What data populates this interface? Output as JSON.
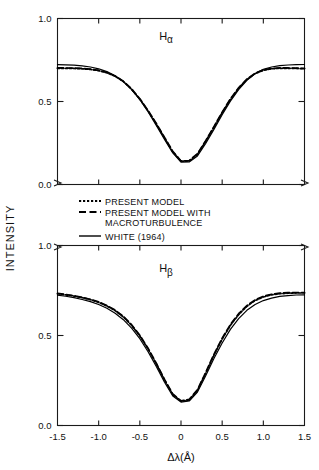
{
  "figure": {
    "ylabel": "INTENSITY",
    "xlabel": "Δλ(Å)",
    "background": "#ffffff",
    "ink": "#000000"
  },
  "legend": {
    "items": [
      {
        "label": "PRESENT MODEL",
        "style": "dotted",
        "swatch": "----"
      },
      {
        "label": "PRESENT MODEL WITH",
        "label2": "MACROTURBULENCE",
        "style": "dashed",
        "swatch": "– –"
      },
      {
        "label": "WHITE (1964)",
        "style": "solid",
        "swatch": "—"
      }
    ]
  },
  "panels": [
    {
      "title": "Hα",
      "title_base": "H",
      "title_sub": "α",
      "yticks": [
        "0.0",
        "0.5",
        "1.0"
      ],
      "ytickvals": [
        0.0,
        0.5,
        1.0
      ],
      "ylim": [
        0.0,
        1.0
      ]
    },
    {
      "title": "Hβ",
      "title_base": "H",
      "title_sub": "β",
      "yticks": [
        "0.0",
        "0.5",
        "1.0"
      ],
      "ytickvals": [
        0.0,
        0.5,
        1.0
      ],
      "ylim": [
        0.0,
        1.0
      ]
    }
  ],
  "xaxis": {
    "ticks": [
      "-1.5",
      "-1.0",
      "-0.5",
      "0",
      "0.5",
      "1.0",
      "1.5"
    ],
    "tickvals": [
      -1.5,
      -1.0,
      -0.5,
      0.0,
      0.5,
      1.0,
      1.5
    ],
    "xlim": [
      -1.5,
      1.5
    ]
  },
  "chart_data": {
    "type": "line",
    "title": "",
    "xlabel": "Δλ(Å)",
    "ylabel": "INTENSITY",
    "xlim": [
      -1.5,
      1.5
    ],
    "ylim": [
      0.0,
      1.0
    ],
    "grid": false,
    "legend_position": "center",
    "panels": [
      {
        "name": "H-alpha",
        "label": "Hα",
        "x": [
          -1.5,
          -1.4,
          -1.3,
          -1.2,
          -1.1,
          -1.0,
          -0.9,
          -0.8,
          -0.7,
          -0.6,
          -0.5,
          -0.4,
          -0.3,
          -0.2,
          -0.1,
          0.0,
          0.1,
          0.2,
          0.3,
          0.4,
          0.5,
          0.6,
          0.7,
          0.8,
          0.9,
          1.0,
          1.1,
          1.2,
          1.3,
          1.4,
          1.5
        ],
        "series": [
          {
            "name": "PRESENT MODEL",
            "style": "dotted",
            "values": [
              0.7,
              0.7,
              0.699,
              0.697,
              0.693,
              0.686,
              0.673,
              0.652,
              0.62,
              0.574,
              0.514,
              0.443,
              0.364,
              0.28,
              0.196,
              0.14,
              0.142,
              0.182,
              0.26,
              0.345,
              0.432,
              0.512,
              0.58,
              0.632,
              0.668,
              0.688,
              0.697,
              0.7,
              0.7,
              0.699,
              0.697
            ]
          },
          {
            "name": "PRESENT MODEL WITH MACROTURBULENCE",
            "style": "dashed",
            "values": [
              0.702,
              0.702,
              0.701,
              0.699,
              0.695,
              0.688,
              0.675,
              0.654,
              0.622,
              0.576,
              0.517,
              0.446,
              0.368,
              0.284,
              0.2,
              0.142,
              0.144,
              0.186,
              0.264,
              0.349,
              0.436,
              0.516,
              0.583,
              0.635,
              0.67,
              0.69,
              0.699,
              0.702,
              0.702,
              0.701,
              0.699
            ]
          },
          {
            "name": "WHITE (1964)",
            "style": "solid",
            "values": [
              0.722,
              0.721,
              0.719,
              0.715,
              0.708,
              0.697,
              0.68,
              0.655,
              0.62,
              0.572,
              0.512,
              0.438,
              0.356,
              0.272,
              0.19,
              0.135,
              0.136,
              0.172,
              0.248,
              0.332,
              0.42,
              0.502,
              0.572,
              0.628,
              0.668,
              0.694,
              0.708,
              0.716,
              0.72,
              0.722,
              0.723
            ]
          }
        ]
      },
      {
        "name": "H-beta",
        "label": "Hβ",
        "x": [
          -1.5,
          -1.4,
          -1.3,
          -1.2,
          -1.1,
          -1.0,
          -0.9,
          -0.8,
          -0.7,
          -0.6,
          -0.5,
          -0.4,
          -0.3,
          -0.2,
          -0.1,
          0.0,
          0.1,
          0.2,
          0.3,
          0.4,
          0.5,
          0.6,
          0.7,
          0.8,
          0.9,
          1.0,
          1.1,
          1.2,
          1.3,
          1.4,
          1.5
        ],
        "series": [
          {
            "name": "PRESENT MODEL",
            "style": "dotted",
            "values": [
              0.732,
              0.726,
              0.719,
              0.71,
              0.699,
              0.684,
              0.664,
              0.638,
              0.603,
              0.556,
              0.497,
              0.425,
              0.342,
              0.252,
              0.172,
              0.135,
              0.142,
              0.195,
              0.29,
              0.39,
              0.48,
              0.556,
              0.616,
              0.662,
              0.694,
              0.714,
              0.726,
              0.732,
              0.735,
              0.736,
              0.736
            ]
          },
          {
            "name": "PRESENT MODEL WITH MACROTURBULENCE",
            "style": "dashed",
            "values": [
              0.734,
              0.728,
              0.721,
              0.712,
              0.701,
              0.687,
              0.667,
              0.641,
              0.606,
              0.56,
              0.501,
              0.429,
              0.346,
              0.256,
              0.175,
              0.137,
              0.145,
              0.199,
              0.295,
              0.395,
              0.485,
              0.561,
              0.621,
              0.666,
              0.698,
              0.718,
              0.729,
              0.735,
              0.738,
              0.739,
              0.739
            ]
          },
          {
            "name": "WHITE (1964)",
            "style": "solid",
            "values": [
              0.724,
              0.718,
              0.71,
              0.7,
              0.688,
              0.672,
              0.651,
              0.624,
              0.588,
              0.541,
              0.482,
              0.41,
              0.328,
              0.24,
              0.164,
              0.13,
              0.136,
              0.186,
              0.276,
              0.372,
              0.458,
              0.534,
              0.594,
              0.64,
              0.672,
              0.694,
              0.708,
              0.717,
              0.722,
              0.725,
              0.726
            ]
          }
        ]
      }
    ]
  }
}
